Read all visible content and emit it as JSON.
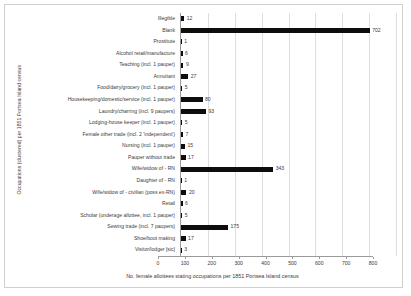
{
  "chart_data": {
    "type": "bar",
    "orientation": "horizontal",
    "title": "",
    "xlabel": "No. female allottees stating occupations per 1851 Portsea Island census",
    "ylabel": "Occupations (clustered) per 1851 Portsea Island census",
    "xlim": [
      0,
      800
    ],
    "xticks": [
      0,
      100,
      200,
      300,
      400,
      500,
      600,
      700,
      800
    ],
    "grid": true,
    "legend": "none",
    "bar_color": "#0d0d0d",
    "data_labels": true,
    "categories": [
      "Illegible",
      "Blank",
      "Prostitute",
      "Alcohol retail/manufacture",
      "Teaching (incl. 1 pauper)",
      "Annuitant",
      "Food/dairy/grocery (incl. 1 pauper)",
      "Housekeeping/domestic/service (incl. 1 pauper)",
      "Laundry/charring (incl. 9 paupers)",
      "Lodging-house keeper (incl. 1 pauper)",
      "Female other trade (incl. 2 'independent')",
      "Nursing (incl. 1 pauper)",
      "Pauper without trade",
      "Wife/widow of - RN",
      "Daughter of - RN",
      "Wife/widow of - civilian (poss ex-RN)",
      "Retail",
      "Scholar (underage allottee, incl. 1 pauper)",
      "Sewing trade (incl. 7 paupers)",
      "Shoe/boot making",
      "Visitor/lodger [sic]"
    ],
    "values": [
      12,
      702,
      1,
      6,
      9,
      27,
      5,
      80,
      93,
      5,
      7,
      15,
      17,
      343,
      1,
      20,
      6,
      5,
      175,
      17,
      3
    ]
  }
}
